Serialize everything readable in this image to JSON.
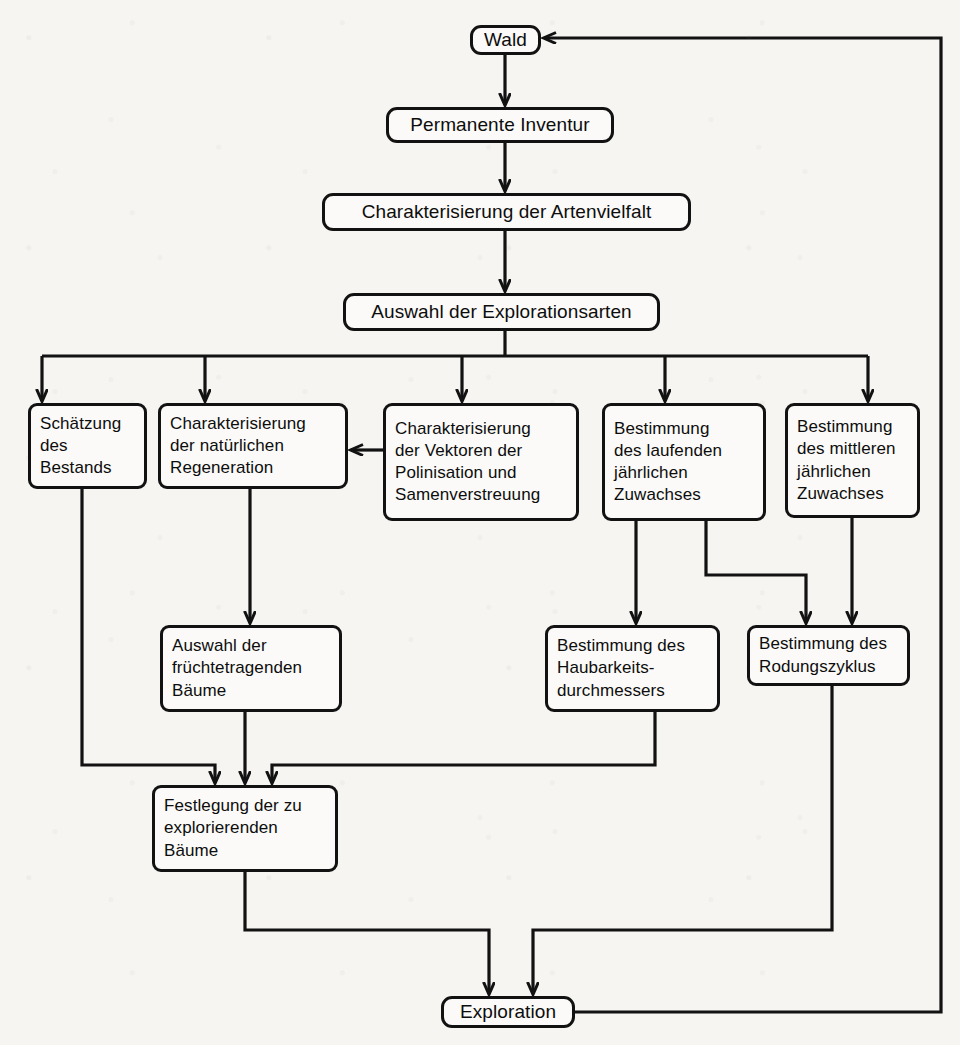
{
  "diagram": {
    "language": "de",
    "background_color": "#f6f5f2",
    "line_color": "#121212",
    "node_fill": "#fbfaf8"
  },
  "nodes": [
    {
      "id": "wald",
      "label": "Wald",
      "x": 470,
      "y": 25,
      "w": 71,
      "h": 30,
      "align": "center",
      "font_size": 19
    },
    {
      "id": "inventur",
      "label": "Permanente Inventur",
      "x": 386,
      "y": 107,
      "w": 228,
      "h": 36,
      "align": "center",
      "font_size": 19
    },
    {
      "id": "artenvielfalt",
      "label": "Charakterisierung der Artenvielfalt",
      "x": 322,
      "y": 193,
      "w": 369,
      "h": 38,
      "align": "center",
      "font_size": 19
    },
    {
      "id": "explorationsarten",
      "label": "Auswahl der Explorationsarten",
      "x": 343,
      "y": 293,
      "w": 317,
      "h": 38,
      "align": "center",
      "font_size": 19
    },
    {
      "id": "bestand",
      "label": "Schätzung\ndes\nBestands",
      "x": 28,
      "y": 403,
      "w": 119,
      "h": 86,
      "align": "left",
      "font_size": 17
    },
    {
      "id": "regeneration",
      "label": "Charakterisierung\nder natürlichen\nRegeneration",
      "x": 158,
      "y": 403,
      "w": 190,
      "h": 86,
      "align": "left",
      "font_size": 17
    },
    {
      "id": "vektoren",
      "label": "Charakterisierung\nder Vektoren der\nPolinisation und\nSamenverstreuung",
      "x": 383,
      "y": 403,
      "w": 196,
      "h": 118,
      "align": "left",
      "font_size": 17
    },
    {
      "id": "laufender",
      "label": "Bestimmung\ndes laufenden\njährlichen\nZuwachses",
      "x": 602,
      "y": 403,
      "w": 164,
      "h": 118,
      "align": "left",
      "font_size": 17
    },
    {
      "id": "mittlerer",
      "label": "Bestimmung\ndes mittleren\njährlichen\nZuwachses",
      "x": 785,
      "y": 403,
      "w": 135,
      "h": 115,
      "align": "left",
      "font_size": 17
    },
    {
      "id": "fruechte",
      "label": "Auswahl der\nfrüchtetragenden\nBäume",
      "x": 160,
      "y": 625,
      "w": 182,
      "h": 87,
      "align": "left",
      "font_size": 17
    },
    {
      "id": "haubarkeit",
      "label": "Bestimmung des\nHaubarkeits-\ndurchmessers",
      "x": 545,
      "y": 625,
      "w": 175,
      "h": 87,
      "align": "left",
      "font_size": 17
    },
    {
      "id": "rodungszyklus",
      "label": "Bestimmung des\nRodungszyklus",
      "x": 747,
      "y": 625,
      "w": 163,
      "h": 61,
      "align": "left",
      "font_size": 17
    },
    {
      "id": "festlegung",
      "label": "Festlegung der zu\nexplorierenden\nBäume",
      "x": 152,
      "y": 785,
      "w": 186,
      "h": 87,
      "align": "left",
      "font_size": 17
    },
    {
      "id": "exploration",
      "label": "Exploration",
      "x": 441,
      "y": 996,
      "w": 134,
      "h": 32,
      "align": "center",
      "font_size": 19
    }
  ],
  "edges": [
    {
      "id": "e-wald-inventur",
      "from": "wald",
      "to": "inventur",
      "kind": "straight-down"
    },
    {
      "id": "e-inventur-artenvielfalt",
      "from": "inventur",
      "to": "artenvielfalt",
      "kind": "straight-down"
    },
    {
      "id": "e-artenvielfalt-auswahl",
      "from": "artenvielfalt",
      "to": "explorationsarten",
      "kind": "straight-down"
    },
    {
      "id": "e-auswahl-bestand",
      "from": "explorationsarten",
      "to": "bestand",
      "kind": "fan-out"
    },
    {
      "id": "e-auswahl-regeneration",
      "from": "explorationsarten",
      "to": "regeneration",
      "kind": "fan-out"
    },
    {
      "id": "e-auswahl-vektoren",
      "from": "explorationsarten",
      "to": "vektoren",
      "kind": "fan-out"
    },
    {
      "id": "e-auswahl-laufender",
      "from": "explorationsarten",
      "to": "laufender",
      "kind": "fan-out"
    },
    {
      "id": "e-auswahl-mittlerer",
      "from": "explorationsarten",
      "to": "mittlerer",
      "kind": "fan-out"
    },
    {
      "id": "e-vektoren-regeneration",
      "from": "vektoren",
      "to": "regeneration",
      "kind": "horizontal-left"
    },
    {
      "id": "e-regeneration-fruechte",
      "from": "regeneration",
      "to": "fruechte",
      "kind": "straight-down"
    },
    {
      "id": "e-laufender-haubarkeit",
      "from": "laufender",
      "to": "haubarkeit",
      "kind": "straight-down"
    },
    {
      "id": "e-laufender-rodung",
      "from": "laufender",
      "to": "rodungszyklus",
      "kind": "elbow-right-down"
    },
    {
      "id": "e-mittlerer-rodung",
      "from": "mittlerer",
      "to": "rodungszyklus",
      "kind": "straight-down"
    },
    {
      "id": "e-bestand-festlegung",
      "from": "bestand",
      "to": "festlegung",
      "kind": "elbow-down-right"
    },
    {
      "id": "e-fruechte-festlegung",
      "from": "fruechte",
      "to": "festlegung",
      "kind": "straight-down"
    },
    {
      "id": "e-haubarkeit-festlegung",
      "from": "haubarkeit",
      "to": "festlegung",
      "kind": "elbow-down-left"
    },
    {
      "id": "e-festlegung-exploration",
      "from": "festlegung",
      "to": "exploration",
      "kind": "elbow-down-right"
    },
    {
      "id": "e-rodung-exploration",
      "from": "rodungszyklus",
      "to": "exploration",
      "kind": "elbow-down-left"
    },
    {
      "id": "e-exploration-wald",
      "from": "exploration",
      "to": "wald",
      "kind": "feedback-loop"
    }
  ]
}
